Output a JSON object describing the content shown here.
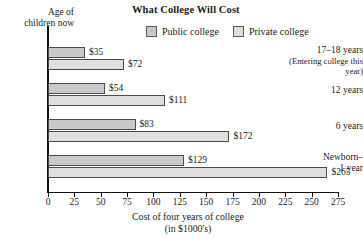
{
  "chart_data": {
    "type": "bar",
    "orientation": "horizontal",
    "title": "What College Will Cost",
    "xlabel": "Cost of four years of college (in $1000's)",
    "xlabel_line1": "Cost of four years of college",
    "xlabel_line2": "(in $1000's)",
    "ylabel": "Age of children now",
    "ylabel_line1": "Age of",
    "ylabel_line2": "children now",
    "categories": [
      "17–18 years (Entering college this year)",
      "12 years",
      "6 years",
      "Newborn–1 year"
    ],
    "category_labels": [
      {
        "main": "17–18 years",
        "sub": "(Entering college this year)"
      },
      {
        "main": "12 years",
        "sub": ""
      },
      {
        "main": "6 years",
        "sub": ""
      },
      {
        "main": "Newborn–",
        "sub": "1 year"
      }
    ],
    "series": [
      {
        "name": "Public college",
        "values": [
          35,
          54,
          83,
          129
        ],
        "labels": [
          "$35",
          "$54",
          "$83",
          "$129"
        ],
        "color": "#c9c9c9"
      },
      {
        "name": "Private college",
        "values": [
          72,
          111,
          172,
          265
        ],
        "labels": [
          "$72",
          "$111",
          "$172",
          "$265"
        ],
        "color": "#dfdfdf"
      }
    ],
    "xlim": [
      0,
      275
    ],
    "xticks": [
      0,
      25,
      50,
      75,
      100,
      125,
      150,
      175,
      200,
      225,
      250,
      275
    ],
    "xtick_labels": [
      "0",
      "25",
      "50",
      "75",
      "100",
      "125",
      "150",
      "175",
      "200",
      "225",
      "250",
      "275"
    ],
    "grid": false,
    "legend_position": "top"
  },
  "legend": {
    "items": [
      {
        "label": "Public college",
        "swatch": "public-swatch"
      },
      {
        "label": "Private college",
        "swatch": "private-swatch"
      }
    ]
  }
}
